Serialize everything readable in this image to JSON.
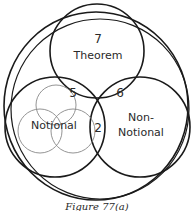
{
  "diagram": {
    "type": "venn",
    "caption": "Figure 77(a)",
    "sets": [
      {
        "id": "outer",
        "label": ""
      },
      {
        "id": "theorem",
        "label": "Theorem",
        "count": "7"
      },
      {
        "id": "notional",
        "label": "Notional"
      },
      {
        "id": "non_notional",
        "label_line1": "Non-",
        "label_line2": "Notional"
      }
    ],
    "intersections": {
      "theorem_notional": "5",
      "theorem_non_notional": "6",
      "notional_non_notional": "2"
    },
    "colors": {
      "stroke": "#1a1a1a",
      "sub_stroke": "#888888",
      "text": "#2a2a2a",
      "background": "#ffffff"
    }
  }
}
